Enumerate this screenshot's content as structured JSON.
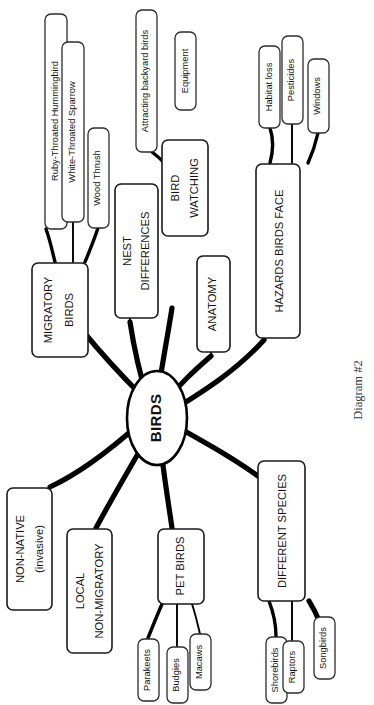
{
  "diagram": {
    "caption": "Diagram #2",
    "orientation": "rotated-90-ccw",
    "center": {
      "label": "BIRDS"
    },
    "branches": [
      {
        "id": "migratory-birds",
        "label": "MIGRATORY BIRDS",
        "line1": "MIGRATORY",
        "line2": "BIRDS",
        "children": [
          {
            "id": "ruby-throated-hummingbird",
            "label": "Ruby-Throated Hummingbird"
          },
          {
            "id": "white-throated-sparrow",
            "label": "White-Throated Sparrow"
          },
          {
            "id": "wood-thrush",
            "label": "Wood Thrush"
          }
        ]
      },
      {
        "id": "nest-differences",
        "label": "NEST DIFFERENCES",
        "line1": "NEST",
        "line2": "DIFFERENCES",
        "children": []
      },
      {
        "id": "bird-watching",
        "label": "BIRD WATCHING",
        "line1": "BIRD",
        "line2": "WATCHING",
        "children": [
          {
            "id": "attracting-backyard-birds",
            "label": "Attracting backyard birds"
          },
          {
            "id": "equipment",
            "label": "Equipment"
          }
        ]
      },
      {
        "id": "anatomy",
        "label": "ANATOMY",
        "line1": "ANATOMY",
        "line2": "",
        "children": []
      },
      {
        "id": "hazards-birds-face",
        "label": "HAZARDS BIRDS FACE",
        "line1": "HAZARDS BIRDS FACE",
        "line2": "",
        "children": [
          {
            "id": "habitat-loss",
            "label": "Habitat loss"
          },
          {
            "id": "pesticides",
            "label": "Pesticides"
          },
          {
            "id": "windows",
            "label": "Windows"
          }
        ]
      },
      {
        "id": "different-species",
        "label": "DIFFERENT SPECIES",
        "line1": "DIFFERENT SPECIES",
        "line2": "",
        "children": [
          {
            "id": "shorebirds",
            "label": "Shorebirds"
          },
          {
            "id": "raptors",
            "label": "Raptors"
          },
          {
            "id": "songbirds",
            "label": "Songbirds"
          }
        ]
      },
      {
        "id": "pet-birds",
        "label": "PET BIRDS",
        "line1": "PET BIRDS",
        "line2": "",
        "children": [
          {
            "id": "parakeets",
            "label": "Parakeets"
          },
          {
            "id": "budgies",
            "label": "Budgies"
          },
          {
            "id": "macaws",
            "label": "Macaws"
          }
        ]
      },
      {
        "id": "local-non-migratory",
        "label": "LOCAL NON-MIGRATORY",
        "line1": "LOCAL",
        "line2": "NON-MIGRATORY",
        "children": []
      },
      {
        "id": "non-native-invasive",
        "label": "NON-NATIVE (invasive)",
        "line1": "NON-NATIVE",
        "line2": "(invasive)",
        "children": []
      }
    ]
  },
  "colors": {
    "stroke": "#000000",
    "node_fill": "#ffffff",
    "text": "#111111",
    "caption": "#3a3a3a"
  }
}
